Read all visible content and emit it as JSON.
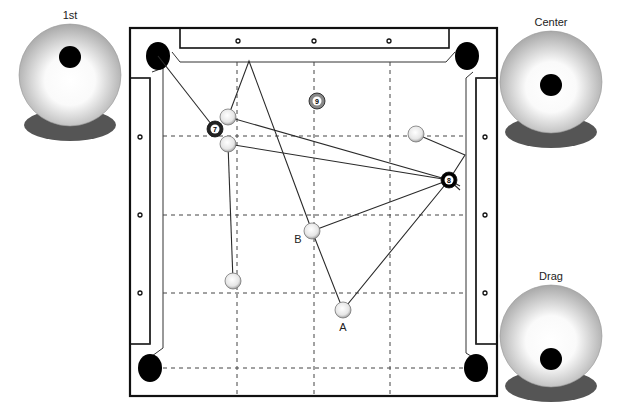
{
  "cue_views": [
    {
      "label": "1st",
      "cx": 70,
      "cy": 75,
      "tip_dx": 0,
      "tip_dy": -18
    },
    {
      "label": "Center",
      "cx": 551,
      "cy": 82,
      "tip_dx": 0,
      "tip_dy": 3
    },
    {
      "label": "Drag",
      "cx": 551,
      "cy": 336,
      "tip_dx": 0,
      "tip_dy": 23
    }
  ],
  "table": {
    "outer_frame": {
      "x": 130,
      "y": 28,
      "w": 367,
      "h": 368
    },
    "playing_area_corners": [
      [
        163,
        62
      ],
      [
        462,
        62
      ],
      [
        462,
        370
      ],
      [
        163,
        370
      ]
    ],
    "diamond_markers": [
      [
        238,
        41
      ],
      [
        314,
        41
      ],
      [
        389,
        41
      ],
      [
        140,
        137
      ],
      [
        140,
        215
      ],
      [
        140,
        293
      ],
      [
        485,
        137
      ],
      [
        485,
        215
      ],
      [
        485,
        293
      ]
    ],
    "pockets": [
      [
        158,
        56
      ],
      [
        467,
        56
      ],
      [
        150,
        368
      ],
      [
        476,
        368
      ]
    ]
  },
  "grid": {
    "vertical_x": [
      237,
      314,
      390
    ],
    "horizontal_y": [
      136,
      215,
      293,
      368
    ]
  },
  "balls": [
    {
      "id": "cue-1",
      "type": "cue",
      "x": 228,
      "y": 117
    },
    {
      "id": "cue-2",
      "type": "cue",
      "x": 228,
      "y": 144
    },
    {
      "id": "cue-3",
      "type": "cue",
      "x": 416,
      "y": 134
    },
    {
      "id": "cue-4",
      "type": "cue",
      "x": 233,
      "y": 281
    },
    {
      "id": "cue-B",
      "type": "cue",
      "x": 312,
      "y": 231,
      "label": "B"
    },
    {
      "id": "cue-A",
      "type": "cue",
      "x": 343,
      "y": 310,
      "label": "A"
    },
    {
      "id": "ball-7",
      "type": "number",
      "number": "7",
      "x": 215,
      "y": 129,
      "color": "#222222"
    },
    {
      "id": "ball-8",
      "type": "number",
      "number": "8",
      "x": 449,
      "y": 180,
      "color": "#000000"
    },
    {
      "id": "ball-9",
      "type": "number",
      "number": "9",
      "x": 317,
      "y": 101,
      "color": "#888888"
    }
  ],
  "paths": [
    {
      "points": [
        [
          158,
          56
        ],
        [
          215,
          129
        ]
      ]
    },
    {
      "points": [
        [
          228,
          117
        ],
        [
          449,
          180
        ],
        [
          460,
          186
        ]
      ]
    },
    {
      "points": [
        [
          228,
          144
        ],
        [
          449,
          180
        ],
        [
          460,
          190
        ]
      ]
    },
    {
      "points": [
        [
          416,
          134
        ],
        [
          465,
          155
        ],
        [
          449,
          180
        ]
      ]
    },
    {
      "points": [
        [
          233,
          281
        ],
        [
          228,
          144
        ]
      ]
    },
    {
      "points": [
        [
          228,
          117
        ],
        [
          249,
          61
        ],
        [
          312,
          231
        ]
      ]
    },
    {
      "points": [
        [
          312,
          231
        ],
        [
          449,
          180
        ]
      ]
    },
    {
      "points": [
        [
          312,
          231
        ],
        [
          343,
          310
        ],
        [
          449,
          180
        ]
      ]
    }
  ],
  "labels": {
    "A": {
      "text": "A",
      "x": 343,
      "y": 331
    },
    "B": {
      "text": "B",
      "x": 298,
      "y": 243
    }
  },
  "colors": {
    "line": "#2a2a2a",
    "grid": "#444444",
    "pocket": "#000000",
    "shadow": "#555555"
  }
}
